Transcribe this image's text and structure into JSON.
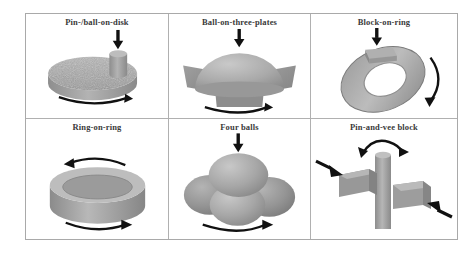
{
  "figure": {
    "caption_present": false,
    "grid": {
      "rows": 2,
      "cols": 3
    },
    "border_color": "#a9a9a9",
    "object_fill": "#a8a8a8",
    "object_shade_dark": "#7e7e7e",
    "object_shade_light": "#c2c2c2",
    "arrow_color": "#111111",
    "background": "#ffffff"
  },
  "cells": [
    {
      "id": "pin-ball-on-disk",
      "title": "Pin-/ball-on-disk",
      "load_arrow": "down-arrow-icon",
      "motion_arrow": "curved-rotation-arrow-icon"
    },
    {
      "id": "ball-on-three-plates",
      "title": "Ball-on-three-plates",
      "load_arrow": "down-arrow-icon",
      "motion_arrow": "curved-rotation-arrow-icon"
    },
    {
      "id": "block-on-ring",
      "title": "Block-on-ring",
      "load_arrow": "down-arrow-icon",
      "motion_arrow": "curved-rotation-arrow-icon"
    },
    {
      "id": "ring-on-ring",
      "title": "Ring-on-ring",
      "load_arrow": "",
      "motion_arrow": "curved-rotation-arrow-icon"
    },
    {
      "id": "four-balls",
      "title": "Four balls",
      "load_arrow": "down-arrow-icon",
      "motion_arrow": "curved-rotation-arrow-icon"
    },
    {
      "id": "pin-and-vee-block",
      "title": "Pin-and-vee block",
      "load_arrow": "side-load-arrow-icon",
      "motion_arrow": "curved-rotation-arrow-icon"
    }
  ]
}
